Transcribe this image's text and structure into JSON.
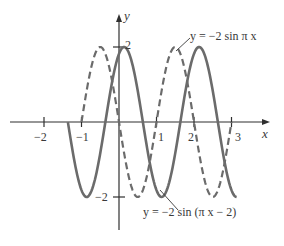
{
  "chart_data": {
    "type": "line",
    "title": "",
    "xlabel": "x",
    "ylabel": "y",
    "xlim": [
      -2.5,
      3.9
    ],
    "ylim": [
      -2.9,
      2.9
    ],
    "grid": false,
    "x_ticks": [
      -2,
      -1,
      1,
      2,
      3
    ],
    "x_tick_labels": [
      "−2",
      "−1",
      "1",
      "2",
      "3"
    ],
    "y_ticks": [
      2,
      -2
    ],
    "y_tick_labels": [
      "2",
      "−2"
    ],
    "series": [
      {
        "name": "y = −2 sin π x",
        "expression": "-2*sin(pi*x)",
        "style": "dashed",
        "x_range": [
          -1,
          3
        ],
        "amplitude": 2,
        "period": 2,
        "phase_shift": 0,
        "zeros": [
          -1,
          0,
          1,
          2,
          3
        ],
        "maxima": [
          [
            -0.5,
            2
          ],
          [
            1.5,
            2
          ]
        ],
        "minima": [
          [
            0.5,
            -2
          ],
          [
            2.5,
            -2
          ]
        ]
      },
      {
        "name": "y = −2 sin (π x − 2)",
        "expression": "-2*sin(pi*x - 2)",
        "style": "solid",
        "x_range": [
          -1.363,
          3.137
        ],
        "amplitude": 2,
        "period": 2,
        "phase_shift": 0.637,
        "zeros": [
          -1.363,
          -0.363,
          0.637,
          1.637,
          2.637
        ],
        "maxima": [
          [
            0.137,
            2
          ],
          [
            2.137,
            2
          ]
        ],
        "minima": [
          [
            -0.863,
            -2
          ],
          [
            1.137,
            -2
          ],
          [
            3.137,
            -2
          ]
        ]
      }
    ],
    "annotations": [
      {
        "text": "y = −2 sin π x",
        "points_to": "dashed curve near x≈1.5"
      },
      {
        "text": "y = −2 sin (π x − 2)",
        "points_to": "solid curve near x≈1.1"
      }
    ]
  },
  "labels": {
    "x_axis": "x",
    "y_axis": "y",
    "tick_x_neg2": "−2",
    "tick_x_neg1": "−1",
    "tick_x_1": "1",
    "tick_x_2": "2",
    "tick_x_3": "3",
    "tick_y_2": "2",
    "tick_y_neg2": "−2",
    "eq_dashed": "y = −2 sin π x",
    "eq_solid": "y = −2 sin (π x − 2)"
  },
  "colors": {
    "axis": "#2f2f2f",
    "curve": "#6b6b6b",
    "text": "#3a3a3a",
    "background": "#ffffff"
  }
}
